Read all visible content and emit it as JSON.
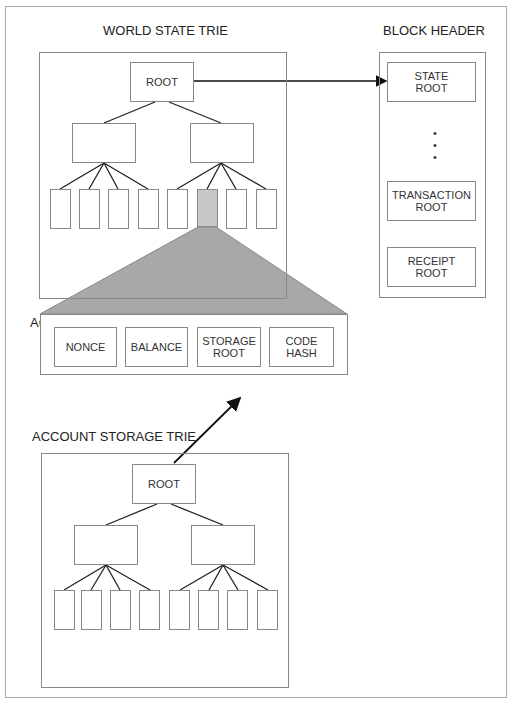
{
  "world_state_trie": {
    "title": "WORLD STATE TRIE",
    "root_label": "ROOT",
    "branch_count": 2,
    "leaf_count": 8,
    "highlighted_leaf_index": 5
  },
  "block_header": {
    "title": "BLOCK HEADER",
    "fields": [
      {
        "label": "STATE\nROOT"
      },
      {
        "label": "TRANSACTION\nROOT"
      },
      {
        "label": "RECEIPT\nROOT"
      }
    ],
    "ellipsis": "•\n•\n•"
  },
  "account": {
    "title": "ACCOUNT",
    "fields": [
      {
        "label": "NONCE"
      },
      {
        "label": "BALANCE"
      },
      {
        "label": "STORAGE\nROOT"
      },
      {
        "label": "CODE\nHASH"
      }
    ]
  },
  "account_storage_trie": {
    "title": "ACCOUNT STORAGE TRIE",
    "root_label": "ROOT",
    "branch_count": 2,
    "leaf_count": 8
  },
  "colors": {
    "highlight_leaf": "#c8c8c8",
    "expansion_fill": "#a8a8a8",
    "line": "#222222",
    "border": "#888888"
  }
}
